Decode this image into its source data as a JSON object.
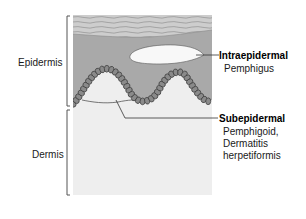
{
  "diagram": {
    "type": "anatomical cross-section",
    "colors": {
      "stratum_corneum": "#c9c9c9",
      "stratum_corneum_stripes": "#9a9a9a",
      "epidermis": "#a9a9a9",
      "basal_cells": "#8a8a8a",
      "basal_cell_outline": "#3a3a3a",
      "dermis": "#eeeeee",
      "blister": "#f7f7f7",
      "pointer_lines": "#333333",
      "bracket": "#555555"
    },
    "layers": [
      {
        "name": "Epidermis",
        "label": "Epidermis"
      },
      {
        "name": "Dermis",
        "label": "Dermis"
      }
    ],
    "callouts": [
      {
        "title": "Intraepidermal",
        "examples": [
          "Pemphigus"
        ]
      },
      {
        "title": "Subepidermal",
        "examples": [
          "Pemphigoid,",
          "Dermatitis",
          "herpetiformis"
        ]
      }
    ]
  }
}
